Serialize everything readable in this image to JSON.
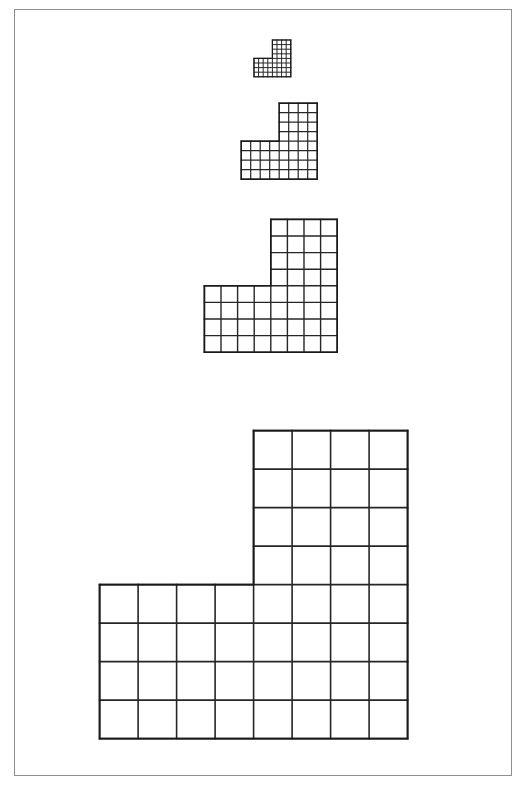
{
  "figure": {
    "background_color": "#ffffff",
    "border_color": "#2b2b2b",
    "line_color": "#262626",
    "border": {
      "x": 14,
      "y": 9,
      "width": 498,
      "height": 767
    }
  },
  "shape_template": {
    "description": "L-shaped polyomino: 8 columns wide, 8 rows tall bounding box; bottom band is 8 wide x 4 tall, upper-right block is 4 wide x 4 tall",
    "cols": 8,
    "rows": 8,
    "bottom_band_cols": 8,
    "bottom_band_rows": 4,
    "top_block_cols": 4,
    "top_block_rows": 4,
    "top_block_col_offset": 4,
    "total_cells": 48
  },
  "shapes": [
    {
      "name": "shape-1",
      "label": "smallest",
      "scale_index": 1,
      "cell_size": 4.6,
      "stroke_width": 1.0,
      "origin_x": 253,
      "origin_y": 39,
      "width_px": 36.8,
      "height_px": 36.8
    },
    {
      "name": "shape-2",
      "label": "small",
      "scale_index": 2,
      "cell_size": 9.5,
      "stroke_width": 1.2,
      "origin_x": 240,
      "origin_y": 102,
      "width_px": 76,
      "height_px": 76
    },
    {
      "name": "shape-3",
      "label": "medium",
      "scale_index": 3,
      "cell_size": 16.6,
      "stroke_width": 1.4,
      "origin_x": 203,
      "origin_y": 218,
      "width_px": 132.8,
      "height_px": 132.8
    },
    {
      "name": "shape-4",
      "label": "large",
      "scale_index": 4,
      "cell_size": 38.5,
      "stroke_width": 1.6,
      "origin_x": 99,
      "origin_y": 430,
      "width_px": 308,
      "height_px": 308
    }
  ]
}
